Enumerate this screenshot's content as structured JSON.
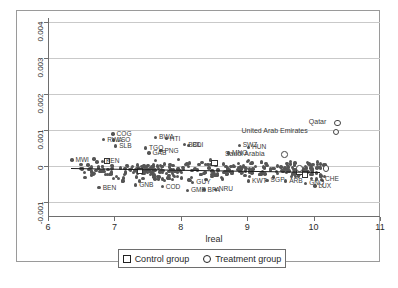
{
  "chart_data": {
    "type": "scatter",
    "title": "",
    "xlabel": "lreal",
    "ylabel": "",
    "xlim": [
      6,
      11
    ],
    "ylim": [
      -0.001,
      0.004
    ],
    "xticks": [
      "6",
      "7",
      "8",
      "9",
      "10",
      "11"
    ],
    "yticks": [
      "0.004",
      "0.003",
      "0.002",
      "0.001",
      "0",
      "-0.001"
    ],
    "grid": true,
    "legend_position": "bottom-center",
    "series": [
      {
        "name": "Control group",
        "marker": "open-square"
      },
      {
        "name": "Treatment group",
        "marker": "open-circle"
      }
    ],
    "fit_line": {
      "x0": 6.35,
      "y0": -6e-05,
      "x1": 10.1,
      "y1": -0.00017
    },
    "labeled_points": [
      {
        "label": "COG",
        "x": 6.98,
        "y": 0.00089,
        "group": "control_data"
      },
      {
        "label": "RWA",
        "x": 6.84,
        "y": 0.00073,
        "group": "control_data"
      },
      {
        "label": "LSO",
        "x": 6.99,
        "y": 0.00072,
        "group": "control_data"
      },
      {
        "label": "SLB",
        "x": 7.02,
        "y": 0.00056,
        "group": "control_data"
      },
      {
        "label": "BWA",
        "x": 7.62,
        "y": 0.0008,
        "group": "control_data"
      },
      {
        "label": "HTI",
        "x": 7.78,
        "y": 0.00076,
        "group": "control_data"
      },
      {
        "label": "BOL",
        "x": 8.06,
        "y": 0.00059,
        "group": "control_data"
      },
      {
        "label": "BDI",
        "x": 8.12,
        "y": 0.00057,
        "group": "control_data"
      },
      {
        "label": "TGO",
        "x": 7.47,
        "y": 0.0005,
        "group": "control_data"
      },
      {
        "label": "PNG",
        "x": 7.7,
        "y": 0.00043,
        "group": "control_data"
      },
      {
        "label": "GAB",
        "x": 7.52,
        "y": 0.00036,
        "group": "control_data"
      },
      {
        "label": "SWZ",
        "x": 8.88,
        "y": 0.00057,
        "group": "control_data"
      },
      {
        "label": "HUN",
        "x": 9.02,
        "y": 0.00052,
        "group": "control_data"
      },
      {
        "label": "MNG",
        "x": 8.72,
        "y": 0.00036,
        "group": "control_data"
      },
      {
        "label": "Saudi Arabia",
        "x": 9.55,
        "y": 0.00033,
        "group": "treatment"
      },
      {
        "label": "Qatar",
        "x": 10.35,
        "y": 0.00121,
        "group": "treatment"
      },
      {
        "label": "United Arab Emirates",
        "x": 10.33,
        "y": 0.00096,
        "group": "treatment"
      },
      {
        "label": "KEN",
        "x": 6.82,
        "y": 0.00013,
        "group": "control_data"
      },
      {
        "label": "MWI",
        "x": 6.36,
        "y": 0.00017,
        "group": "control_data"
      },
      {
        "label": "BEN",
        "x": 6.77,
        "y": -0.0006,
        "group": "control_data"
      },
      {
        "label": "GNB",
        "x": 7.32,
        "y": -0.00053,
        "group": "control_data"
      },
      {
        "label": "COD",
        "x": 7.72,
        "y": -0.00057,
        "group": "control_data"
      },
      {
        "label": "GUY",
        "x": 8.18,
        "y": -0.00045,
        "group": "control_data"
      },
      {
        "label": "GMB",
        "x": 8.1,
        "y": -0.00068,
        "group": "control_data"
      },
      {
        "label": "BFA",
        "x": 8.35,
        "y": -0.00066,
        "group": "control_data"
      },
      {
        "label": "NRU",
        "x": 8.52,
        "y": -0.00065,
        "group": "control_data"
      },
      {
        "label": "SGP",
        "x": 9.3,
        "y": -0.0004,
        "group": "control_data"
      },
      {
        "label": "KWT",
        "x": 9.02,
        "y": -0.00042,
        "group": "control_data"
      },
      {
        "label": "ARB",
        "x": 9.58,
        "y": -0.00042,
        "group": "control_data"
      },
      {
        "label": "CHE",
        "x": 10.12,
        "y": -0.00037,
        "group": "control_data"
      },
      {
        "label": "LUX",
        "x": 10.02,
        "y": -0.00056,
        "group": "control_data"
      },
      {
        "label": "GNQ",
        "x": 9.88,
        "y": -0.00048,
        "group": "control_data"
      }
    ]
  },
  "axes": {
    "x_title": "lreal",
    "x_tick_labels": [
      "6",
      "7",
      "8",
      "9",
      "10",
      "11"
    ],
    "y_tick_labels": [
      "0.004",
      "0.003",
      "0.002",
      "0.001",
      "0",
      "-0.001"
    ]
  },
  "legend": {
    "control_label": "Control group",
    "treatment_label": "Treatment group"
  }
}
